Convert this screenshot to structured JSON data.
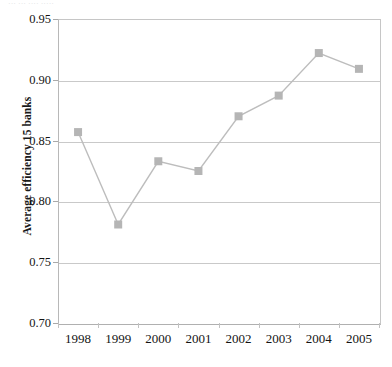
{
  "figure": {
    "caption_fragment": "··· ··· ···· ·····",
    "background_color": "#ffffff"
  },
  "chart_data": {
    "type": "line",
    "title": "",
    "subtitle": "",
    "xlabel": "",
    "ylabel": "Average efficiency 15 banks",
    "categories": [
      "1998",
      "1999",
      "2000",
      "2001",
      "2002",
      "2003",
      "2004",
      "2005"
    ],
    "values": [
      0.857,
      0.781,
      0.833,
      0.825,
      0.87,
      0.887,
      0.922,
      0.909
    ],
    "series": [
      {
        "name": "Average efficiency 15 banks",
        "values": [
          0.857,
          0.781,
          0.833,
          0.825,
          0.87,
          0.887,
          0.922,
          0.909
        ],
        "line_color": "#bdbdbd",
        "marker_color": "#b5b5b5",
        "marker": "square"
      }
    ],
    "ylim": [
      0.7,
      0.95
    ],
    "yticks": [
      0.95,
      0.9,
      0.85,
      0.8,
      0.75,
      0.7
    ],
    "ytick_labels": [
      "0.95",
      "0.90",
      "0.85",
      "0.80",
      "0.75",
      "0.70"
    ],
    "grid": "horizontal",
    "legend": "none",
    "annotations": []
  },
  "colors": {
    "line": "#bdbdbd",
    "marker": "#b5b5b5",
    "gridline": "#c9c9c9",
    "axis": "#b0b0b0",
    "text": "#141414"
  }
}
